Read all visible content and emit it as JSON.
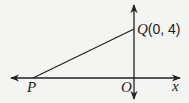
{
  "diagram": {
    "colors": {
      "background": "#f4f4f2",
      "stroke": "#222222"
    },
    "axes": {
      "x_label": "x",
      "origin_label": "O"
    },
    "points": {
      "P": {
        "label": "P"
      },
      "Q": {
        "label": "Q",
        "coords": "(0, 4)"
      }
    },
    "segments": [
      {
        "from": "P",
        "to": "Q"
      }
    ]
  }
}
